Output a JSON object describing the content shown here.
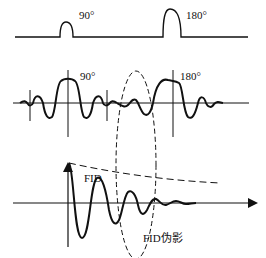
{
  "diagram": {
    "pulse_sequence": {
      "pulse1_label": "90°",
      "pulse2_label": "180°"
    },
    "echo_signal": {
      "pulse1_label": "90°",
      "pulse2_label": "180°"
    },
    "fid_plot": {
      "fid_label": "FID",
      "artifact_label": "FID伪影"
    },
    "colors": {
      "stroke": "#111111",
      "background": "#ffffff"
    }
  }
}
